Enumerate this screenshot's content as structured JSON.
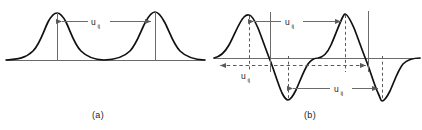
{
  "figure": {
    "background_color": "#ffffff",
    "curve_color": "#111111",
    "axis_color": "#6b6b6b",
    "guide_color": "#6b6b6b",
    "dash_color": "#5a5a5a",
    "text_color": "#1a1a1a",
    "panels": [
      {
        "id": "a",
        "caption": "(a)",
        "caption_x": 98,
        "caption_y": 118,
        "description": "two positive gaussian-like bumps on a baseline with u_ij separation measured peak to peak",
        "baseline_y": 60,
        "baseline_x0": 6,
        "baseline_x1": 205,
        "peaks": [
          {
            "x": 57,
            "y": 13
          },
          {
            "x": 155,
            "y": 12
          }
        ],
        "drop_lines": [
          {
            "x": 57,
            "y_top": 13,
            "y_bottom": 60
          },
          {
            "x": 155,
            "y_top": 12,
            "y_bottom": 60
          }
        ],
        "measure": {
          "label": "u",
          "sub": "ij",
          "label_x": 95,
          "label_y": 25,
          "arrow_y": 21,
          "from_x": 57,
          "to_x": 155
        }
      },
      {
        "id": "b",
        "caption": "(b)",
        "caption_x": 310,
        "caption_y": 118,
        "description": "two bipolar (derivative-like) oscillations about a zero axis with three u_ij separations marked",
        "zero_axis_y": 58,
        "zero_axis_x0": 214,
        "zero_axis_x1": 420,
        "peaks": [
          {
            "x": 249,
            "y": 15
          },
          {
            "x": 345,
            "y": 14
          }
        ],
        "troughs": [
          {
            "x": 288,
            "y": 100
          },
          {
            "x": 382,
            "y": 101
          }
        ],
        "solid_guides": [
          {
            "x": 270,
            "y_top": 12,
            "y_bottom": 72
          },
          {
            "x": 368,
            "y_top": 11,
            "y_bottom": 72
          }
        ],
        "dashed_guides": [
          {
            "x": 249,
            "y_top": 15,
            "y_bottom": 72
          },
          {
            "x": 288,
            "y_top": 56,
            "y_bottom": 100
          },
          {
            "x": 345,
            "y_top": 14,
            "y_bottom": 72
          },
          {
            "x": 382,
            "y_top": 56,
            "y_bottom": 101
          }
        ],
        "measures": [
          {
            "name": "peak-to-peak",
            "label": "u",
            "sub": "ij",
            "label_x": 290,
            "label_y": 25,
            "arrow_y": 21,
            "from_x": 249,
            "to_x": 345,
            "style": "solid"
          },
          {
            "name": "left-zero-crossing",
            "label": "u",
            "sub": "ij",
            "label_x": 246,
            "label_y": 79,
            "arrow_y": 65,
            "from_x": 270,
            "to_x": 220,
            "style": "dashed"
          },
          {
            "name": "zero-crossing-span",
            "label": "u",
            "sub": "ij",
            "label_x": 349,
            "label_y": 92,
            "arrow_y": 65,
            "from_x": 270,
            "to_x": 368,
            "style": "dashed"
          },
          {
            "name": "trough-to-trough",
            "label": "u",
            "sub": "ij",
            "label_x": 340,
            "label_y": 91,
            "arrow_y": 88,
            "from_x": 288,
            "to_x": 382,
            "style": "solid"
          }
        ]
      }
    ]
  }
}
